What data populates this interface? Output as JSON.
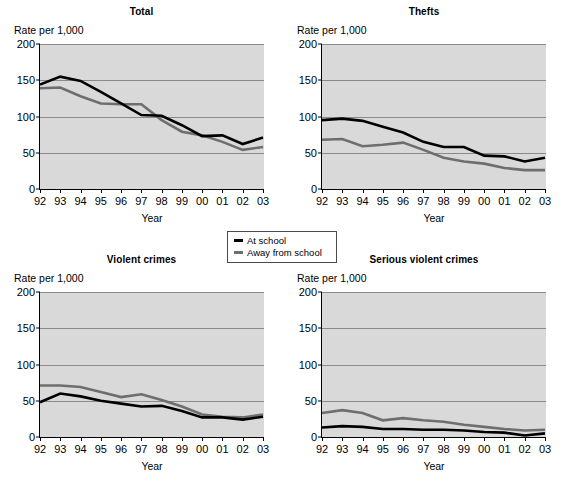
{
  "figure": {
    "ylabel": "Rate per 1,000",
    "xlabel": "Year",
    "ylim": [
      0,
      200
    ],
    "yticks": [
      "0",
      "50",
      "100",
      "150",
      "200"
    ],
    "xticks": [
      "92",
      "93",
      "94",
      "95",
      "96",
      "97",
      "98",
      "99",
      "00",
      "01",
      "02",
      "03"
    ],
    "colors": {
      "at_school": "#000000",
      "away_from_school": "#6e6e6e",
      "plot_background": "#d9d9d9",
      "gridline": "#8a8a8a",
      "axis": "#000000"
    },
    "footnote": ""
  },
  "legend": {
    "position": "center",
    "entries": [
      {
        "label": "At school",
        "color": "#000000",
        "swatch": "line-swatch-black"
      },
      {
        "label": "Away from school",
        "color": "#6e6e6e",
        "swatch": "line-swatch-gray"
      }
    ]
  },
  "chart_data": [
    {
      "type": "line",
      "title": "Total",
      "xlabel": "Year",
      "ylabel": "Rate per 1,000",
      "ylim": [
        0,
        200
      ],
      "yticks": [
        0,
        50,
        100,
        150,
        200
      ],
      "grid": true,
      "legend_position": "center",
      "categories": [
        "92",
        "93",
        "94",
        "95",
        "96",
        "97",
        "98",
        "99",
        "00",
        "01",
        "02",
        "03"
      ],
      "series": [
        {
          "name": "At school",
          "color": "#000000",
          "values": [
            144,
            155,
            149,
            134,
            118,
            102,
            101,
            88,
            73,
            74,
            62,
            71
          ]
        },
        {
          "name": "Away from school",
          "color": "#6e6e6e",
          "values": [
            139,
            140,
            128,
            118,
            117,
            117,
            95,
            79,
            74,
            65,
            54,
            58
          ]
        }
      ]
    },
    {
      "type": "line",
      "title": "Thefts",
      "xlabel": "Year",
      "ylabel": "Rate per 1,000",
      "ylim": [
        0,
        200
      ],
      "yticks": [
        0,
        50,
        100,
        150,
        200
      ],
      "grid": true,
      "legend_position": "center",
      "categories": [
        "92",
        "93",
        "94",
        "95",
        "96",
        "97",
        "98",
        "99",
        "00",
        "01",
        "02",
        "03"
      ],
      "series": [
        {
          "name": "At school",
          "color": "#000000",
          "values": [
            95,
            97,
            94,
            86,
            78,
            65,
            58,
            58,
            46,
            45,
            38,
            43
          ]
        },
        {
          "name": "Away from school",
          "color": "#6e6e6e",
          "values": [
            68,
            69,
            59,
            61,
            64,
            54,
            43,
            38,
            35,
            29,
            26,
            26
          ]
        }
      ]
    },
    {
      "type": "line",
      "title": "Violent crimes",
      "xlabel": "Year",
      "ylabel": "Rate per 1,000",
      "ylim": [
        0,
        200
      ],
      "yticks": [
        0,
        50,
        100,
        150,
        200
      ],
      "grid": true,
      "legend_position": "center",
      "categories": [
        "92",
        "93",
        "94",
        "95",
        "96",
        "97",
        "98",
        "99",
        "00",
        "01",
        "02",
        "03"
      ],
      "series": [
        {
          "name": "At school",
          "color": "#000000",
          "values": [
            48,
            60,
            56,
            50,
            46,
            42,
            43,
            36,
            27,
            27,
            24,
            28
          ]
        },
        {
          "name": "Away from school",
          "color": "#6e6e6e",
          "values": [
            71,
            71,
            69,
            62,
            55,
            59,
            51,
            42,
            31,
            28,
            27,
            31
          ]
        }
      ]
    },
    {
      "type": "line",
      "title": "Serious violent crimes",
      "xlabel": "Year",
      "ylabel": "Rate per 1,000",
      "ylim": [
        0,
        200
      ],
      "yticks": [
        0,
        50,
        100,
        150,
        200
      ],
      "grid": true,
      "legend_position": "center",
      "categories": [
        "92",
        "93",
        "94",
        "95",
        "96",
        "97",
        "98",
        "99",
        "00",
        "01",
        "02",
        "03"
      ],
      "series": [
        {
          "name": "At school",
          "color": "#000000",
          "values": [
            13,
            15,
            14,
            11,
            11,
            10,
            10,
            9,
            7,
            6,
            2,
            5
          ]
        },
        {
          "name": "Away from school",
          "color": "#6e6e6e",
          "values": [
            33,
            37,
            33,
            23,
            26,
            23,
            21,
            17,
            14,
            11,
            9,
            10
          ]
        }
      ]
    }
  ]
}
